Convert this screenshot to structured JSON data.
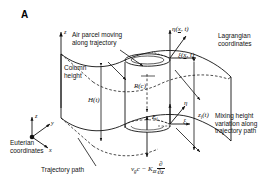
{
  "figure": {
    "panel_label": "A",
    "type": "schematic-diagram"
  },
  "annotations": {
    "air_parcel": "Air parcel moving\nalong trajectory",
    "column_height": "Column\nheight",
    "lagrangian": "Lagrangian\ncoordinates",
    "eulerian": "Euterian\ncoordinates",
    "trajectory_path": "Trajectory path",
    "mixing_height": "Mixing height\nvariation along\ntrajectory path"
  },
  "math": {
    "column_height_symbol": "H(t)",
    "reaction_symbol": "R(c)",
    "emission_symbol": "E",
    "emission_sub": "i",
    "mixing_height_symbol": "z",
    "mixing_height_sub": "i",
    "mixing_height_arg": "(t)",
    "eta_label": "η(",
    "xi_label": "ξ(",
    "coord_arg_var": "x",
    "coord_arg_rest": ", t)",
    "eta_axis": "η",
    "xi_axis": "ξ",
    "deposition_vg": "v",
    "deposition_vg_sub": "g",
    "deposition_c": "c − K",
    "deposition_kzz_sub": "zz",
    "deposition_num": "∂",
    "deposition_den": "∂z"
  },
  "axes": {
    "z_top": "z",
    "z_eulerian": "z",
    "y_eulerian": "y",
    "x_eulerian": "x"
  },
  "colors": {
    "line": "#111111",
    "background": "#ffffff",
    "dashed": "#111111"
  }
}
